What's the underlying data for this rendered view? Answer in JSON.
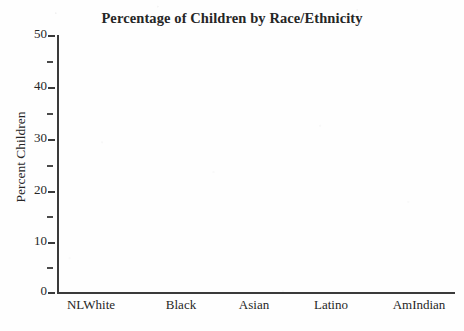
{
  "figure": {
    "background_color": "#fefefe",
    "ink_color": "#2b2b2b"
  },
  "chart_data": {
    "type": "bar",
    "title": "Percentage of Children by Race/Ethnicity",
    "xlabel": "",
    "ylabel": "Percent Children",
    "categories": [
      "NLWhite",
      "Black",
      "Asian",
      "Latino",
      "AmIndian"
    ],
    "values": [
      null,
      null,
      null,
      null,
      null
    ],
    "series": [],
    "ylim": [
      0,
      50
    ],
    "y_major_ticks": [
      0,
      10,
      20,
      30,
      40,
      50
    ],
    "y_major_tick_labels": [
      "0",
      "10",
      "20",
      "30",
      "40",
      "50"
    ],
    "y_minor_ticks": [
      5,
      15,
      25,
      35,
      45
    ],
    "grid": false,
    "legend": false,
    "legend_position": "none",
    "annotations": [],
    "note": "Plot area is empty — no bars or data marks are drawn in the figure."
  },
  "axes": {
    "y_ticks": [
      {
        "value": 50,
        "label": "50",
        "minor": false,
        "y": 36
      },
      {
        "value": 45,
        "label": "",
        "minor": true,
        "y": 62
      },
      {
        "value": 40,
        "label": "40",
        "minor": false,
        "y": 88
      },
      {
        "value": 35,
        "label": "",
        "minor": true,
        "y": 114
      },
      {
        "value": 30,
        "label": "30",
        "minor": false,
        "y": 140
      },
      {
        "value": 25,
        "label": "",
        "minor": true,
        "y": 166
      },
      {
        "value": 20,
        "label": "20",
        "minor": false,
        "y": 192
      },
      {
        "value": 15,
        "label": "",
        "minor": true,
        "y": 217
      },
      {
        "value": 10,
        "label": "10",
        "minor": false,
        "y": 243
      },
      {
        "value": 5,
        "label": "",
        "minor": true,
        "y": 268
      },
      {
        "value": 0,
        "label": "0",
        "minor": false,
        "y": 293
      }
    ],
    "x_categories": [
      {
        "label": "NLWhite",
        "x": 91
      },
      {
        "label": "Black",
        "x": 181
      },
      {
        "label": "Asian",
        "x": 254
      },
      {
        "label": "Latino",
        "x": 331
      },
      {
        "label": "AmIndian",
        "x": 419
      }
    ]
  }
}
